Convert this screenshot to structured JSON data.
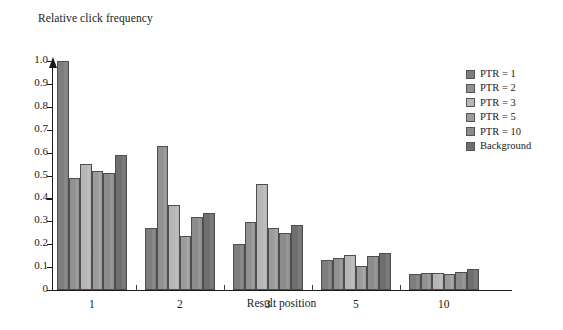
{
  "chart_data": {
    "type": "bar",
    "title": "",
    "subtitle": "",
    "ylabel": "Relative click frequency",
    "xlabel": "Result position",
    "categories": [
      "1",
      "2",
      "3",
      "5",
      "10"
    ],
    "ylim": [
      0,
      1.0
    ],
    "ytick_labels": [
      "0",
      "0.1",
      "0.2",
      "0.3",
      "0.4",
      "0.5",
      "0.6",
      "0.7",
      "0.8",
      "0.9",
      "1.0"
    ],
    "ytick_values": [
      0,
      0.1,
      0.2,
      0.3,
      0.4,
      0.5,
      0.6,
      0.7,
      0.8,
      0.9,
      1.0
    ],
    "grid": false,
    "legend_position": "right",
    "series": [
      {
        "name": "PTR = 1",
        "color": "#7d7d7d",
        "values": [
          1.0,
          0.27,
          0.2,
          0.13,
          0.07
        ]
      },
      {
        "name": "PTR = 2",
        "color": "#919191",
        "values": [
          0.49,
          0.63,
          0.295,
          0.138,
          0.075
        ]
      },
      {
        "name": "PTR = 3",
        "color": "#b6b6b6",
        "values": [
          0.55,
          0.37,
          0.465,
          0.155,
          0.075
        ]
      },
      {
        "name": "PTR = 5",
        "color": "#9c9c9c",
        "values": [
          0.52,
          0.238,
          0.27,
          0.105,
          0.07
        ]
      },
      {
        "name": "PTR = 10",
        "color": "#8c8c8c",
        "values": [
          0.51,
          0.32,
          0.25,
          0.15,
          0.077
        ]
      },
      {
        "name": "Background",
        "color": "#6f6f6f",
        "values": [
          0.59,
          0.335,
          0.285,
          0.16,
          0.09
        ]
      }
    ]
  }
}
